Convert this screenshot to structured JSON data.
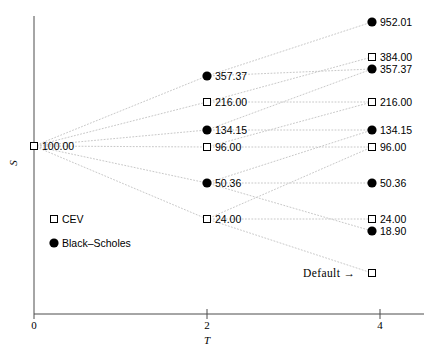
{
  "chart_data": {
    "type": "scatter",
    "title": "",
    "xlabel": "T",
    "ylabel": "S",
    "xlim": [
      0,
      4.35
    ],
    "xticks": [
      "0",
      "2",
      "4"
    ],
    "xtickvalues": [
      0,
      2,
      4
    ],
    "grid": false,
    "legend": {
      "position": "middle-left",
      "entries": [
        {
          "label": "CEV",
          "marker": "open-square"
        },
        {
          "label": "Black–Scholes",
          "marker": "filled-circle"
        }
      ]
    },
    "annotations": [
      {
        "text": "Default →",
        "marker": "open-square",
        "x": 4,
        "note": "default / absorbing state node"
      }
    ],
    "nodes": [
      {
        "id": "root",
        "t": 0,
        "label": "100.00",
        "value": 100.0,
        "marker": "open-square",
        "series": "CEV",
        "px": 34,
        "py": 146
      },
      {
        "id": "m1",
        "t": 2,
        "label": "357.37",
        "value": 357.37,
        "marker": "filled-circle",
        "series": "Black-Scholes",
        "px": 207,
        "py": 76
      },
      {
        "id": "m2",
        "t": 2,
        "label": "216.00",
        "value": 216.0,
        "marker": "open-square",
        "series": "CEV",
        "px": 207,
        "py": 102
      },
      {
        "id": "m3",
        "t": 2,
        "label": "134.15",
        "value": 134.15,
        "marker": "filled-circle",
        "series": "Black-Scholes",
        "px": 207,
        "py": 130
      },
      {
        "id": "m4",
        "t": 2,
        "label": "96.00",
        "value": 96.0,
        "marker": "open-square",
        "series": "CEV",
        "px": 207,
        "py": 147
      },
      {
        "id": "m5",
        "t": 2,
        "label": "50.36",
        "value": 50.36,
        "marker": "filled-circle",
        "series": "Black-Scholes",
        "px": 207,
        "py": 183
      },
      {
        "id": "m6",
        "t": 2,
        "label": "24.00",
        "value": 24.0,
        "marker": "open-square",
        "series": "CEV",
        "px": 207,
        "py": 219
      },
      {
        "id": "r1",
        "t": 4,
        "label": "952.01",
        "value": 952.01,
        "marker": "filled-circle",
        "series": "Black-Scholes",
        "px": 372,
        "py": 22
      },
      {
        "id": "r2",
        "t": 4,
        "label": "384.00",
        "value": 384.0,
        "marker": "open-square",
        "series": "CEV",
        "px": 372,
        "py": 57
      },
      {
        "id": "r3",
        "t": 4,
        "label": "357.37",
        "value": 357.37,
        "marker": "filled-circle",
        "series": "Black-Scholes",
        "px": 372,
        "py": 69
      },
      {
        "id": "r4",
        "t": 4,
        "label": "216.00",
        "value": 216.0,
        "marker": "open-square",
        "series": "CEV",
        "px": 372,
        "py": 102
      },
      {
        "id": "r5",
        "t": 4,
        "label": "134.15",
        "value": 134.15,
        "marker": "filled-circle",
        "series": "Black-Scholes",
        "px": 372,
        "py": 130
      },
      {
        "id": "r6",
        "t": 4,
        "label": "96.00",
        "value": 96.0,
        "marker": "open-square",
        "series": "CEV",
        "px": 372,
        "py": 147
      },
      {
        "id": "r7",
        "t": 4,
        "label": "50.36",
        "value": 50.36,
        "marker": "filled-circle",
        "series": "Black-Scholes",
        "px": 372,
        "py": 183
      },
      {
        "id": "r8",
        "t": 4,
        "label": "24.00",
        "value": 24.0,
        "marker": "open-square",
        "series": "CEV",
        "px": 372,
        "py": 219
      },
      {
        "id": "r9",
        "t": 4,
        "label": "18.90",
        "value": 18.9,
        "marker": "filled-circle",
        "series": "Black-Scholes",
        "px": 372,
        "py": 231
      },
      {
        "id": "rdef",
        "t": 4,
        "label": "",
        "value": null,
        "marker": "open-square",
        "series": "CEV",
        "px": 372,
        "py": 273
      }
    ],
    "edges": [
      [
        "root",
        "m1"
      ],
      [
        "root",
        "m2"
      ],
      [
        "root",
        "m3"
      ],
      [
        "root",
        "m4"
      ],
      [
        "root",
        "m5"
      ],
      [
        "root",
        "m6"
      ],
      [
        "m1",
        "r1"
      ],
      [
        "m1",
        "r3"
      ],
      [
        "m2",
        "r2"
      ],
      [
        "m2",
        "r4"
      ],
      [
        "m3",
        "r3"
      ],
      [
        "m3",
        "r5"
      ],
      [
        "m4",
        "r4"
      ],
      [
        "m4",
        "r6"
      ],
      [
        "m5",
        "r5"
      ],
      [
        "m5",
        "r7"
      ],
      [
        "m6",
        "r6"
      ],
      [
        "m6",
        "r8"
      ],
      [
        "m5",
        "r9"
      ],
      [
        "m6",
        "rdef"
      ]
    ]
  },
  "axes": {
    "x_title": "T",
    "y_title": "S",
    "x_ticks": [
      {
        "label": "0",
        "px": 34
      },
      {
        "label": "2",
        "px": 207
      },
      {
        "label": "4",
        "px": 380
      }
    ],
    "axis_color": "#4d4d4d"
  },
  "legend": {
    "cev_label": "CEV",
    "bs_label": "Black–Scholes"
  },
  "annotation": {
    "default_text": "Default →"
  },
  "style": {
    "line_color": "#c8c8c8",
    "marker_fill": "#000000",
    "marker_stroke": "#000000",
    "background": "#ffffff"
  }
}
